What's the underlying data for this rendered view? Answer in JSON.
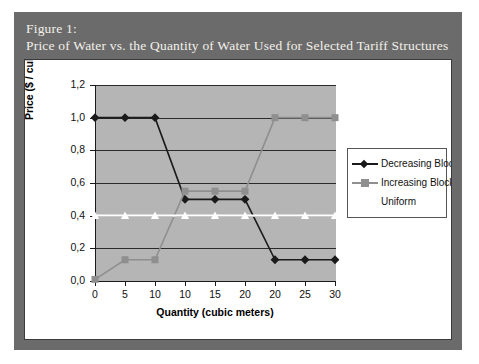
{
  "figure": {
    "caption_line1": "Figure 1:",
    "caption_line2": "Price of Water vs. the Quantity of Water Used for Selected Tariff Structures"
  },
  "colors": {
    "plot_background": "#b5b5b5",
    "frame": "#6b6b6b",
    "panel": "#ffffff",
    "decreasing_block": "#1a1a1a",
    "increasing_block": "#8f8f8f",
    "uniform": "#ffffff",
    "gridline": "#2a2a2a",
    "axis": "#1a1a1a"
  },
  "legend": {
    "position": "right",
    "entries": [
      {
        "label": "Decreasing Block",
        "marker": "diamond",
        "color": "#1a1a1a"
      },
      {
        "label": "Increasing Block",
        "marker": "square",
        "color": "#8f8f8f"
      },
      {
        "label": "Uniform",
        "marker": "triangle",
        "color": "#ffffff"
      }
    ]
  },
  "chart_data": {
    "type": "line",
    "title": "Price of Water vs. the Quantity of Water Used for Selected Tariff Structures",
    "xlabel": "Quantity (cubic meters)",
    "ylabel": "Price ($ / cubic meter)",
    "categories": [
      "0",
      "5",
      "10",
      "10",
      "15",
      "20",
      "20",
      "25",
      "30"
    ],
    "ylim": [
      0.0,
      1.2
    ],
    "yticks": [
      "0,0",
      "0,2",
      "0,4",
      "0,6",
      "0,8",
      "1,0",
      "1,2"
    ],
    "ytick_values": [
      0.0,
      0.2,
      0.4,
      0.6,
      0.8,
      1.0,
      1.2
    ],
    "grid": true,
    "series": [
      {
        "name": "Decreasing Block",
        "marker": "diamond",
        "color": "#1a1a1a",
        "values": [
          1.0,
          1.0,
          1.0,
          0.5,
          0.5,
          0.5,
          0.13,
          0.13,
          0.13
        ]
      },
      {
        "name": "Increasing Block",
        "marker": "square",
        "color": "#8f8f8f",
        "values": [
          0.01,
          0.13,
          0.13,
          0.55,
          0.55,
          0.55,
          1.0,
          1.0,
          1.0
        ]
      },
      {
        "name": "Uniform",
        "marker": "triangle",
        "color": "#ffffff",
        "values": [
          0.4,
          0.4,
          0.4,
          0.4,
          0.4,
          0.4,
          0.4,
          0.4,
          0.4
        ]
      }
    ]
  }
}
